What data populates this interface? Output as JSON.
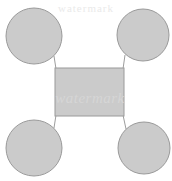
{
  "diagram": {
    "type": "node-link",
    "background_color": "#ffffff",
    "node_fill_color": "#cbcbcb",
    "node_stroke_color": "#9a9a9a",
    "connector_color": "#9d9d9d",
    "canvas": {
      "width": 172,
      "height": 181
    },
    "center_node": {
      "shape": "rectangle",
      "label": "",
      "x": 55,
      "y": 68,
      "width": 69,
      "height": 48
    },
    "outer_nodes": [
      {
        "id": "top-left",
        "shape": "circle",
        "label": "",
        "cx": 34,
        "cy": 36,
        "r": 28
      },
      {
        "id": "top-right",
        "shape": "circle",
        "label": "",
        "cx": 143,
        "cy": 35,
        "r": 26
      },
      {
        "id": "bottom-left",
        "shape": "circle",
        "label": "",
        "cx": 34,
        "cy": 148,
        "r": 28
      },
      {
        "id": "bottom-right",
        "shape": "circle",
        "label": "",
        "cx": 144,
        "cy": 148,
        "r": 26
      }
    ],
    "connectors": [
      {
        "id": "center-to-top-left",
        "from": "center-node",
        "to": "top-left",
        "x1": 56,
        "y1": 69,
        "x2": 54,
        "y2": 56
      },
      {
        "id": "center-to-top-right",
        "from": "center-node",
        "to": "top-right",
        "x1": 123,
        "y1": 69,
        "x2": 125,
        "y2": 55
      },
      {
        "id": "center-to-bottom-left",
        "from": "center-node",
        "to": "bottom-left",
        "x1": 56,
        "y1": 115,
        "x2": 54,
        "y2": 128
      },
      {
        "id": "center-to-bottom-right",
        "from": "center-node",
        "to": "bottom-right",
        "x1": 123,
        "y1": 115,
        "x2": 126,
        "y2": 129
      }
    ],
    "watermark": {
      "center_text": "watermark",
      "top_text": "watermark",
      "center_color": "#d6d6d6",
      "top_color": "#eaeaea"
    }
  }
}
